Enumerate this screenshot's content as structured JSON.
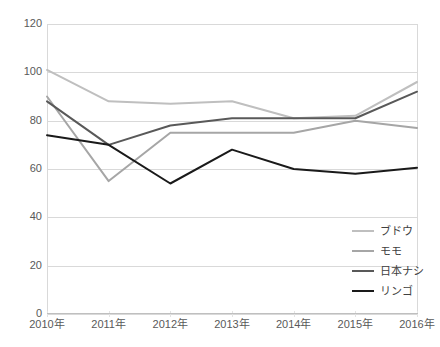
{
  "chart_data": {
    "type": "line",
    "title": "",
    "xlabel": "",
    "ylabel": "",
    "x": [
      "2010年",
      "2011年",
      "2012年",
      "2013年",
      "2014年",
      "2015年",
      "2016年"
    ],
    "categories": [
      "2010年",
      "2011年",
      "2012年",
      "2013年",
      "2014年",
      "2015年",
      "2016年"
    ],
    "ylim": [
      0,
      120
    ],
    "ytick_interval": 20,
    "yticks": [
      0,
      20,
      40,
      60,
      80,
      100,
      120
    ],
    "ytick_labels": [
      "0",
      "20",
      "40",
      "60",
      "80",
      "100",
      "120"
    ],
    "grid": true,
    "grid_axis": "y",
    "legend_position": "right-bottom",
    "series": [
      {
        "name": "ブドウ",
        "color": "#bfbfbf",
        "values": [
          101,
          88,
          87,
          88,
          81,
          82,
          96
        ]
      },
      {
        "name": "モモ",
        "color": "#a6a6a6",
        "values": [
          90,
          55,
          75,
          75,
          75,
          80,
          77
        ]
      },
      {
        "name": "日本ナシ",
        "color": "#595959",
        "values": [
          88,
          70,
          78,
          81,
          81,
          81,
          92
        ]
      },
      {
        "name": "リンゴ",
        "color": "#1a1a1a",
        "values": [
          74,
          70,
          54,
          68,
          60,
          58,
          60.5
        ]
      }
    ]
  },
  "legend": {
    "items": [
      {
        "label": "ブドウ",
        "color": "#bfbfbf"
      },
      {
        "label": "モモ",
        "color": "#a6a6a6"
      },
      {
        "label": "日本ナシ",
        "color": "#595959"
      },
      {
        "label": "リンゴ",
        "color": "#1a1a1a"
      }
    ]
  }
}
